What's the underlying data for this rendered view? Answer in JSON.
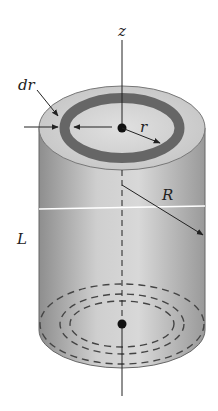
{
  "diagram": {
    "labels": {
      "axis": "z",
      "shell_thickness": "dr",
      "shell_radius": "r",
      "outer_radius": "R",
      "length": "L"
    },
    "colors": {
      "background": "#ffffff",
      "cylinder_side_dark": "#8e8e8e",
      "cylinder_side_light": "#d6d6d6",
      "top_face": "#cfcfcf",
      "shell_ring": "#666666",
      "lines": "#222222"
    }
  }
}
